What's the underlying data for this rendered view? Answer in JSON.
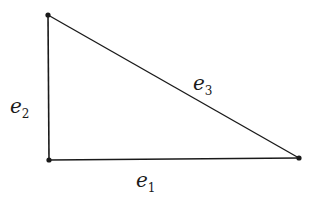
{
  "diagram": {
    "type": "right-triangle",
    "stroke_color": "#1a1a1a",
    "vertices": [
      {
        "id": "top-left",
        "x": 48,
        "y": 15
      },
      {
        "id": "bottom-left",
        "x": 49,
        "y": 160
      },
      {
        "id": "bottom-right",
        "x": 299,
        "y": 158
      }
    ],
    "edges": [
      {
        "id": "e1",
        "label_base": "e",
        "label_sub": "1",
        "from": "bottom-left",
        "to": "bottom-right"
      },
      {
        "id": "e2",
        "label_base": "e",
        "label_sub": "2",
        "from": "top-left",
        "to": "bottom-left"
      },
      {
        "id": "e3",
        "label_base": "e",
        "label_sub": "3",
        "from": "top-left",
        "to": "bottom-right"
      }
    ]
  }
}
